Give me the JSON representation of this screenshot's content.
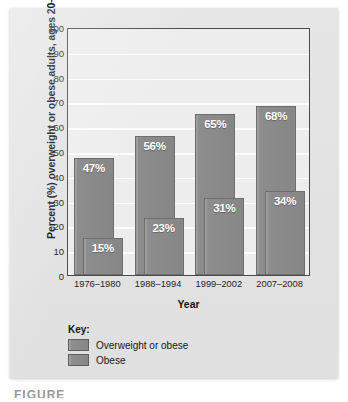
{
  "chart_data": {
    "type": "bar",
    "title": "",
    "xlabel": "Year",
    "ylabel": "Percent (%) overweight or obese adults, ages 20–74",
    "ylim": [
      0,
      100
    ],
    "ytick_step": 10,
    "yticks": [
      "100",
      "90",
      "80",
      "70",
      "60",
      "50",
      "40",
      "30",
      "20",
      "10",
      "0"
    ],
    "grid": true,
    "legend_position": "below-plot",
    "categories": [
      "1976–1980",
      "1988–1994",
      "1999–2002",
      "2007–2008"
    ],
    "series": [
      {
        "name": "Overweight or obese",
        "values": [
          47,
          56,
          65,
          68
        ],
        "labels": [
          "47%",
          "56%",
          "65%",
          "68%"
        ],
        "color": "#8d8d8d"
      },
      {
        "name": "Obese",
        "values": [
          15,
          23,
          31,
          34
        ],
        "labels": [
          "15%",
          "23%",
          "31%",
          "34%"
        ],
        "color": "#8d8d8d"
      }
    ]
  },
  "legend": {
    "title": "Key:",
    "items": [
      {
        "label": "Overweight or obese"
      },
      {
        "label": "Obese"
      }
    ]
  },
  "caption": {
    "clipped_text": "FIGURE"
  },
  "colors": {
    "panel_background": "#e3e3e3",
    "plot_background": "#ededed",
    "gridline": "#fdfdfd",
    "axis_border": "#4a4a4a",
    "bar_fill": "#8d8d8d",
    "bar_border": "#6e6e6e",
    "value_label": "#ffffff",
    "text": "#1d1d1d"
  }
}
